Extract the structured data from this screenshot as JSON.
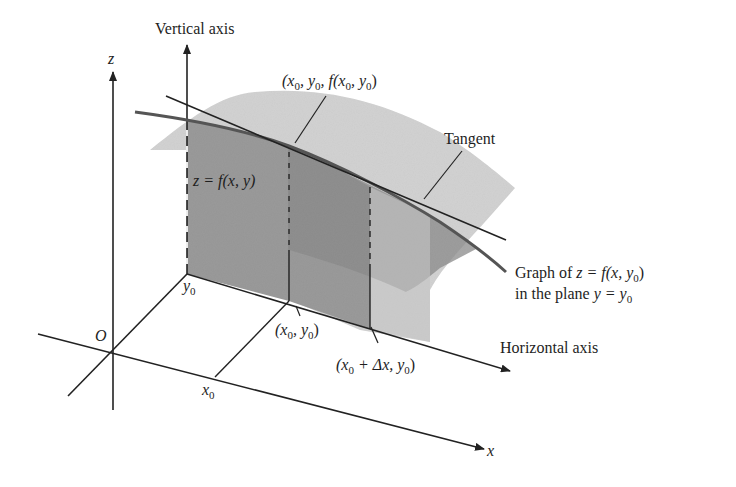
{
  "diagram": {
    "colors": {
      "background": "#ffffff",
      "ink": "#222222",
      "surface_light": "#d4d4d4",
      "surface_mid": "#b5b5b5",
      "surface_dark": "#8f8f8f",
      "curve": "#555555"
    },
    "axes": {
      "z_label": "z",
      "x_label": "x",
      "origin_label": "O"
    },
    "labels": {
      "vertical_axis": "Vertical axis",
      "horizontal_axis": "Horizontal axis",
      "tangent": "Tangent",
      "surface": {
        "text": "z = f(x, y)"
      },
      "point_3d": {
        "pre": "(x",
        "s1": "0",
        "mid1": ", y",
        "s2": "0",
        "mid2": ", f(x",
        "s3": "0",
        "mid3": ", y",
        "s4": "0",
        "post": ")"
      },
      "graph_line1": {
        "pre": "Graph of ",
        "eq": "z = f(x, y",
        "sub": "0",
        "post": ")"
      },
      "graph_line2": {
        "pre": "in the plane ",
        "eq": "y = y",
        "sub": "0"
      },
      "y0": {
        "base": "y",
        "sub": "0"
      },
      "x0": {
        "base": "x",
        "sub": "0"
      },
      "point_base": {
        "pre": "(x",
        "s1": "0",
        "mid": ", y",
        "s2": "0",
        "post": ")"
      },
      "point_delta": {
        "pre": "(x",
        "s1": "0",
        "mid": " + Δx, y",
        "s2": "0",
        "post": ")"
      }
    }
  }
}
